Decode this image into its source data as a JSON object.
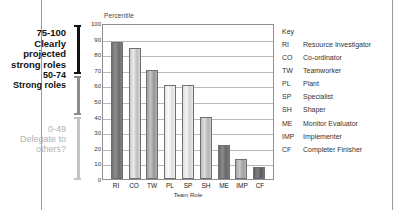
{
  "chart_data": {
    "type": "bar",
    "title": "",
    "xlabel": "Team Role",
    "ylabel": "Percentile",
    "categories": [
      "RI",
      "CO",
      "TW",
      "PL",
      "SP",
      "SH",
      "ME",
      "IMP",
      "CF"
    ],
    "values": [
      88,
      84,
      70,
      60,
      60,
      40,
      22,
      13,
      8
    ],
    "ylim": [
      0,
      100
    ],
    "yticks": [
      0,
      10,
      20,
      30,
      40,
      50,
      60,
      70,
      80,
      90,
      100
    ],
    "grid": true,
    "legend_position": "right",
    "series": [
      {
        "name": "Percentile",
        "values": [
          88,
          84,
          70,
          60,
          60,
          40,
          22,
          13,
          8
        ]
      }
    ]
  },
  "annotations": [
    {
      "range": "75-100",
      "description_line1": "Clearly projected",
      "description_line2": "strong roles",
      "color": "#111111"
    },
    {
      "range": "50-74",
      "description_line1": "Strong roles",
      "description_line2": "",
      "color": "#8c8c8c"
    },
    {
      "range": "0-49",
      "description_line1": "Delegate to",
      "description_line2": "others?",
      "color": "#c4c4c4"
    }
  ],
  "legend": {
    "title": "Key",
    "entries": [
      {
        "abbr": "RI",
        "label": "Resource Investigator"
      },
      {
        "abbr": "CO",
        "label": "Co-ordinator"
      },
      {
        "abbr": "TW",
        "label": "Teamworker"
      },
      {
        "abbr": "PL",
        "label": "Plant"
      },
      {
        "abbr": "SP",
        "label": "Specialist"
      },
      {
        "abbr": "SH",
        "label": "Shaper"
      },
      {
        "abbr": "ME",
        "label": "Monitor Evaluator"
      },
      {
        "abbr": "IMP",
        "label": "Implementer"
      },
      {
        "abbr": "CF",
        "label": "Completer Finisher"
      }
    ]
  }
}
